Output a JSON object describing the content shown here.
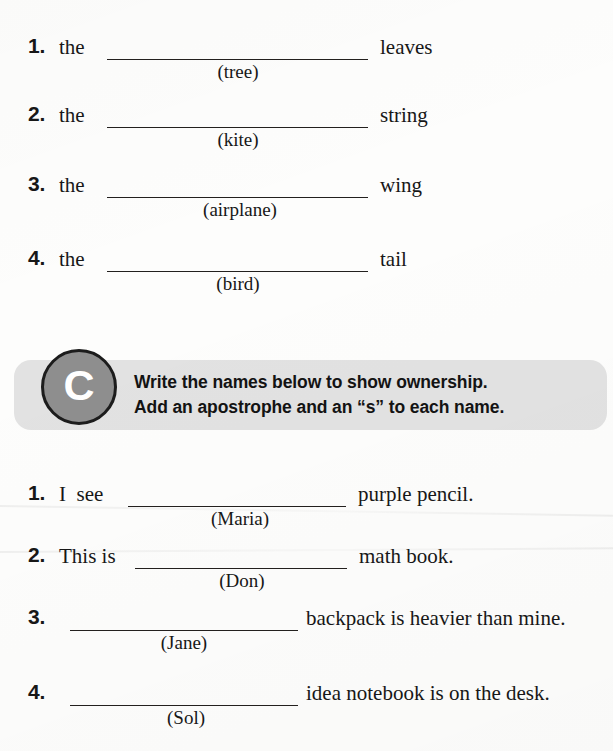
{
  "worksheet": {
    "section_b": {
      "items": [
        {
          "number": "1.",
          "stem": "the",
          "hint": "(tree)",
          "tail": "leaves"
        },
        {
          "number": "2.",
          "stem": "the",
          "hint": "(kite)",
          "tail": "string"
        },
        {
          "number": "3.",
          "stem": "the",
          "hint": "(airplane)",
          "tail": "wing"
        },
        {
          "number": "4.",
          "stem": "the",
          "hint": "(bird)",
          "tail": "tail"
        }
      ]
    },
    "section_c": {
      "badge_letter": "C",
      "instruction_line1": "Write the names below to show ownership.",
      "instruction_line2": "Add an apostrophe and an “s” to each name.",
      "banner_color": "#e2e2e2",
      "badge_color": "#8e8e8e",
      "items": [
        {
          "number": "1.",
          "stem": "I  see",
          "hint": "(Maria)",
          "tail": "purple pencil."
        },
        {
          "number": "2.",
          "stem": "This is",
          "hint": "(Don)",
          "tail": "math book."
        },
        {
          "number": "3.",
          "stem": "",
          "hint": "(Jane)",
          "tail": "backpack is heavier than mine."
        },
        {
          "number": "4.",
          "stem": "",
          "hint": "(Sol)",
          "tail": "idea notebook is on the desk."
        }
      ]
    }
  }
}
